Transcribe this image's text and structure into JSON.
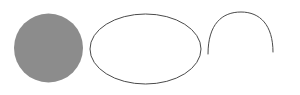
{
  "canvas": {
    "width": 300,
    "height": 95,
    "background_color": "#ffffff"
  },
  "figure": {
    "shape_count": 3
  },
  "shapes": [
    {
      "name": "filled-circle",
      "type": "circle",
      "fill_color": "#8c8c8c",
      "stroke_color": "none",
      "stroke_width": 0,
      "center_x": 48.5,
      "center_y": 48,
      "radius": 34.5,
      "bounds": {
        "left": 14,
        "top": 13,
        "right": 83,
        "bottom": 83
      }
    },
    {
      "name": "ellipse-outline",
      "type": "ellipse",
      "fill_color": "none",
      "stroke_color": "#4a4a4a",
      "stroke_width": 1,
      "center_x": 145.5,
      "center_y": 49,
      "radius_x": 55.5,
      "radius_y": 35,
      "bounds": {
        "left": 90,
        "top": 14,
        "right": 201,
        "bottom": 84
      }
    },
    {
      "name": "open-arc",
      "type": "arc",
      "fill_color": "none",
      "stroke_color": "#4a4a4a",
      "stroke_width": 1,
      "center_x": 241,
      "center_y": 47,
      "radius_x": 33,
      "radius_y": 35,
      "start_x": 208,
      "start_y": 54,
      "end_x": 273,
      "end_y": 52,
      "apex_y": 12,
      "open_side": "bottom",
      "path": "M 208 54 C 208 24 222 12 241 12 C 260 12 273 25 273 52"
    }
  ]
}
